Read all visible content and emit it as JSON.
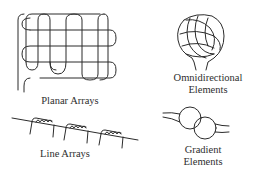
{
  "diagram": {
    "panels": [
      {
        "id": "planar-arrays",
        "label": "Planar Arrays"
      },
      {
        "id": "omnidirectional-elements",
        "label_line1": "Omnidirectional",
        "label_line2": "Elements"
      },
      {
        "id": "line-arrays",
        "label": "Line Arrays"
      },
      {
        "id": "gradient-elements",
        "label_line1": "Gradient",
        "label_line2": "Elements"
      }
    ],
    "colors": {
      "stroke": "#2b2b2b",
      "text": "#2e2e2e",
      "background": "#ffffff"
    }
  }
}
